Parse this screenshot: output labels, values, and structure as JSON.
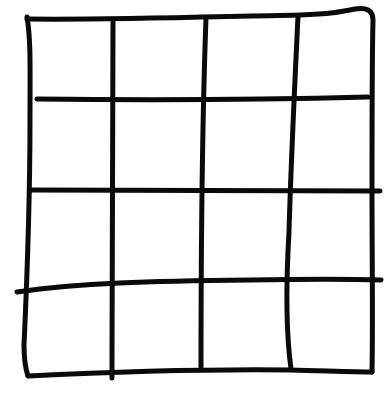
{
  "diagram": {
    "type": "hand-drawn-grid",
    "rows": 4,
    "columns": 4,
    "stroke_color": "#0a0a0a",
    "background_color": "#ffffff",
    "stroke_width": 5,
    "outline": {
      "top": "M27,19 C110,20 200,17 300,15 C330,14 340,12 355,9 C366,7 373,10 373,20 C372,60 372,110 372,190 C372,260 373,320 372,372",
      "left": "M27,17 C31,40 30,70 30,120 C30,200 27,280 24,345 C24,360 26,370 28,376",
      "bottom": "M28,376 C110,372 200,369 290,370 C330,371 355,372 372,372"
    },
    "horizontal_lines": [
      {
        "id": "row-line-1",
        "path": "M37,99 C130,100 250,100 368,97"
      },
      {
        "id": "row-line-2",
        "path": "M30,190 C130,191 250,190 380,191"
      },
      {
        "id": "row-line-3",
        "path": "M17,292 C80,283 150,281 250,280 C310,279 350,279 381,280"
      }
    ],
    "vertical_lines": [
      {
        "id": "col-line-1",
        "path": "M113,22 C113,120 112,250 112,378"
      },
      {
        "id": "col-line-2",
        "path": "M206,18 C203,100 201,250 201,369"
      },
      {
        "id": "col-line-3",
        "path": "M298,16 C295,80 291,160 289,232 C285,300 287,340 291,369"
      }
    ]
  }
}
